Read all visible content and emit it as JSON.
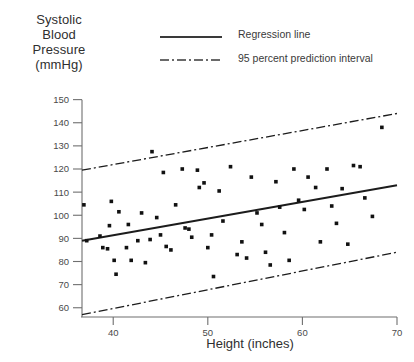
{
  "chart_data": {
    "type": "scatter",
    "title": "",
    "ylabel_lines": [
      "Systolic",
      "Blood",
      "Pressure",
      "(mmHg)"
    ],
    "xlabel": "Height (inches)",
    "xlim": [
      36.7,
      70
    ],
    "ylim": [
      56,
      152
    ],
    "grid": false,
    "xticks": [
      40,
      50,
      60,
      70
    ],
    "yticks": [
      60,
      70,
      80,
      90,
      100,
      110,
      120,
      130,
      140,
      150
    ],
    "legend_position": "top-right",
    "legend": [
      {
        "label": "Regression line",
        "style": "solid"
      },
      {
        "label": "95 percent prediction interval",
        "style": "dash-dot"
      }
    ],
    "series": [
      {
        "name": "Observations",
        "marker": "square",
        "color": "#111111",
        "points": [
          [
            36.9,
            104.5
          ],
          [
            37.2,
            89.0
          ],
          [
            38.6,
            91.0
          ],
          [
            38.9,
            86.0
          ],
          [
            39.4,
            85.5
          ],
          [
            39.6,
            95.5
          ],
          [
            39.8,
            106.0
          ],
          [
            40.1,
            80.5
          ],
          [
            40.3,
            74.5
          ],
          [
            40.6,
            101.5
          ],
          [
            41.4,
            86.0
          ],
          [
            41.6,
            96.0
          ],
          [
            41.9,
            80.5
          ],
          [
            42.6,
            89.0
          ],
          [
            43.0,
            101.0
          ],
          [
            43.4,
            79.5
          ],
          [
            43.9,
            89.5
          ],
          [
            44.1,
            127.5
          ],
          [
            44.6,
            99.0
          ],
          [
            45.0,
            91.5
          ],
          [
            45.3,
            118.5
          ],
          [
            45.6,
            86.5
          ],
          [
            46.1,
            85.0
          ],
          [
            46.6,
            104.5
          ],
          [
            47.3,
            120.0
          ],
          [
            47.6,
            94.5
          ],
          [
            48.0,
            94.0
          ],
          [
            48.3,
            90.5
          ],
          [
            48.9,
            119.5
          ],
          [
            49.1,
            112.0
          ],
          [
            49.6,
            114.0
          ],
          [
            50.0,
            86.0
          ],
          [
            50.4,
            91.5
          ],
          [
            50.6,
            73.5
          ],
          [
            51.2,
            110.5
          ],
          [
            51.6,
            97.5
          ],
          [
            52.4,
            121.0
          ],
          [
            53.1,
            83.0
          ],
          [
            53.6,
            88.5
          ],
          [
            54.1,
            81.5
          ],
          [
            54.6,
            116.5
          ],
          [
            55.2,
            101.0
          ],
          [
            55.7,
            96.0
          ],
          [
            56.1,
            84.0
          ],
          [
            56.6,
            78.5
          ],
          [
            57.2,
            114.5
          ],
          [
            57.6,
            103.5
          ],
          [
            58.1,
            92.5
          ],
          [
            58.6,
            80.5
          ],
          [
            59.1,
            120.0
          ],
          [
            59.6,
            106.5
          ],
          [
            60.2,
            102.5
          ],
          [
            60.6,
            116.5
          ],
          [
            61.4,
            112.0
          ],
          [
            61.9,
            88.5
          ],
          [
            62.6,
            120.0
          ],
          [
            63.1,
            104.0
          ],
          [
            63.6,
            96.5
          ],
          [
            64.2,
            111.5
          ],
          [
            64.8,
            87.5
          ],
          [
            65.4,
            121.5
          ],
          [
            66.1,
            121.0
          ],
          [
            66.6,
            107.5
          ],
          [
            67.4,
            99.5
          ],
          [
            68.4,
            138.0
          ]
        ]
      }
    ],
    "lines": [
      {
        "name": "regression",
        "style": "solid",
        "x": [
          36.7,
          70
        ],
        "y": [
          89.0,
          113.0
        ]
      },
      {
        "name": "upper_prediction_interval",
        "style": "dash-dot",
        "x": [
          36.7,
          70
        ],
        "y": [
          119.5,
          144.0
        ]
      },
      {
        "name": "lower_prediction_interval",
        "style": "dash-dot",
        "x": [
          36.7,
          70
        ],
        "y": [
          57.0,
          84.0
        ]
      }
    ]
  }
}
